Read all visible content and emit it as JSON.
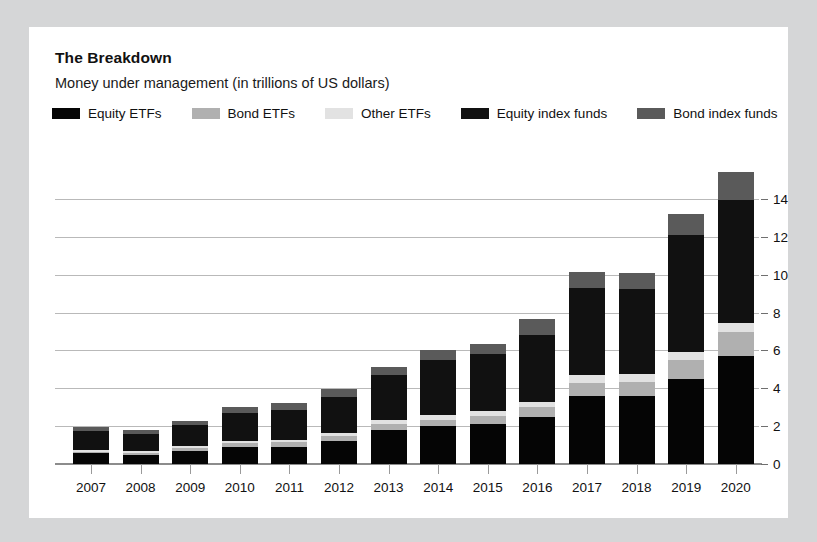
{
  "card": {
    "title": "The Breakdown",
    "subtitle": "Money under management (in trillions of US dollars)"
  },
  "colors": {
    "page_background": "#d5d6d7",
    "card_background": "#ffffff",
    "equity_etfs": "#050505",
    "bond_etfs": "#b0b0b0",
    "other_etfs": "#e2e2e2",
    "equity_index_funds": "#111111",
    "bond_index_funds": "#5a5a5a",
    "gridline": "#b9b9b9",
    "axis": "#8c8c8c",
    "text": "#111111"
  },
  "legend": {
    "items": [
      {
        "label": "Equity ETFs",
        "color": "#050505",
        "key": "equity_etfs"
      },
      {
        "label": "Bond ETFs",
        "color": "#b0b0b0",
        "key": "bond_etfs"
      },
      {
        "label": "Other ETFs",
        "color": "#e2e2e2",
        "key": "other_etfs"
      },
      {
        "label": "Equity index funds",
        "color": "#111111",
        "key": "equity_index_funds"
      },
      {
        "label": "Bond index funds",
        "color": "#5a5a5a",
        "key": "bond_index_funds"
      }
    ]
  },
  "chart_data": {
    "type": "bar",
    "stacked": true,
    "title": "The Breakdown",
    "subtitle": "Money under management (in trillions of US dollars)",
    "xlabel": "",
    "ylabel": "",
    "ylim": [
      0,
      14
    ],
    "yticks": [
      0,
      2,
      4,
      6,
      8,
      10,
      12,
      14
    ],
    "ytick_labels": [
      "0",
      "2",
      "4",
      "6",
      "8",
      "10",
      "12",
      "14"
    ],
    "y_axis_position": "right",
    "grid": true,
    "legend_position": "top",
    "categories": [
      "2007",
      "2008",
      "2009",
      "2010",
      "2011",
      "2012",
      "2013",
      "2014",
      "2015",
      "2016",
      "2017",
      "2018",
      "2019",
      "2020"
    ],
    "series": [
      {
        "name": "Equity ETFs",
        "color": "#050505",
        "values": [
          0.6,
          0.5,
          0.7,
          0.9,
          0.9,
          1.2,
          1.8,
          2.0,
          2.1,
          2.5,
          3.6,
          3.6,
          4.5,
          5.7
        ]
      },
      {
        "name": "Bond ETFs",
        "color": "#b0b0b0",
        "values": [
          0.05,
          0.1,
          0.15,
          0.2,
          0.25,
          0.3,
          0.3,
          0.35,
          0.45,
          0.5,
          0.7,
          0.75,
          1.0,
          1.3
        ]
      },
      {
        "name": "Other ETFs",
        "color": "#e2e2e2",
        "values": [
          0.1,
          0.1,
          0.1,
          0.1,
          0.1,
          0.15,
          0.2,
          0.25,
          0.25,
          0.3,
          0.4,
          0.4,
          0.4,
          0.45
        ]
      },
      {
        "name": "Equity index funds",
        "color": "#111111",
        "values": [
          1.0,
          0.9,
          1.1,
          1.5,
          1.6,
          1.9,
          2.4,
          2.9,
          3.0,
          3.5,
          4.6,
          4.5,
          6.2,
          6.5
        ]
      },
      {
        "name": "Bond index funds",
        "color": "#5a5a5a",
        "values": [
          0.2,
          0.2,
          0.25,
          0.3,
          0.35,
          0.4,
          0.45,
          0.5,
          0.55,
          0.85,
          0.85,
          0.85,
          1.1,
          1.5
        ]
      }
    ],
    "totals": [
      1.95,
      1.8,
      2.3,
      3.0,
      3.2,
      3.95,
      5.15,
      6.0,
      6.35,
      7.65,
      10.15,
      10.1,
      13.2,
      15.45
    ]
  }
}
